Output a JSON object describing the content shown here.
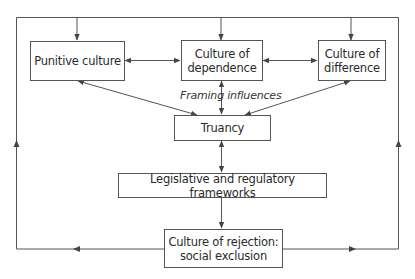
{
  "diagram": {
    "nodes": {
      "punitive": {
        "label": "Punitive culture"
      },
      "dependence": {
        "label_line1": "Culture of",
        "label_line2": "dependence"
      },
      "difference": {
        "label_line1": "Culture of",
        "label_line2": "difference"
      },
      "truancy": {
        "label": "Truancy"
      },
      "legislative": {
        "label": "Legislative and regulatory frameworks"
      },
      "rejection": {
        "label_line1": "Culture of rejection:",
        "label_line2": "social exclusion"
      }
    },
    "annotations": {
      "framing": "Framing influences"
    },
    "edges": [
      {
        "from": "punitive",
        "to": "dependence",
        "type": "bidirectional"
      },
      {
        "from": "dependence",
        "to": "difference",
        "type": "bidirectional"
      },
      {
        "from": "punitive",
        "to": "truancy",
        "type": "bidirectional"
      },
      {
        "from": "dependence",
        "to": "truancy",
        "type": "bidirectional"
      },
      {
        "from": "difference",
        "to": "truancy",
        "type": "bidirectional"
      },
      {
        "from": "truancy",
        "to": "legislative",
        "type": "bidirectional"
      },
      {
        "from": "legislative",
        "to": "rejection",
        "type": "directed"
      },
      {
        "from": "rejection",
        "to": "punitive",
        "type": "feedback-loop-left"
      },
      {
        "from": "rejection",
        "to": "dependence",
        "type": "feedback-loop-top"
      },
      {
        "from": "rejection",
        "to": "difference",
        "type": "feedback-loop-right"
      }
    ],
    "colors": {
      "line": "#555555",
      "text": "#2a2a2a",
      "background": "#ffffff"
    }
  }
}
